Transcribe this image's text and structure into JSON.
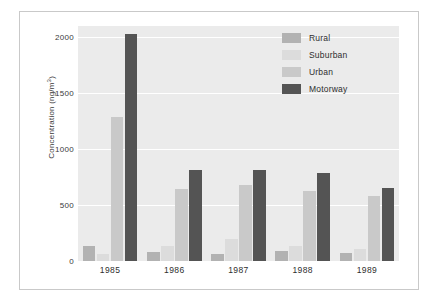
{
  "chart_data": {
    "type": "bar",
    "title": "",
    "xlabel": "",
    "ylabel": "Concentration (ng/m3)",
    "ylabel_unit_base": "Concentration (ng/m",
    "ylabel_unit_sup": "3",
    "ylabel_unit_tail": ")",
    "categories": [
      "1985",
      "1986",
      "1987",
      "1988",
      "1989"
    ],
    "ylim": [
      0,
      2100
    ],
    "yticks": [
      0,
      500,
      1000,
      1500,
      2000
    ],
    "ytick_labels": [
      "0",
      "500",
      "1000",
      "1500",
      "2000"
    ],
    "grid": true,
    "legend_position": "top-right",
    "series": [
      {
        "name": "Rural",
        "color": "#b2b2b2",
        "values": [
          130,
          80,
          65,
          90,
          75
        ]
      },
      {
        "name": "Suburban",
        "color": "#dcdcdc",
        "values": [
          60,
          130,
          195,
          135,
          110
        ]
      },
      {
        "name": "Urban",
        "color": "#c9c9c9",
        "values": [
          1290,
          640,
          680,
          625,
          585
        ]
      },
      {
        "name": "Motorway",
        "color": "#545454",
        "values": [
          2030,
          810,
          815,
          785,
          650
        ]
      }
    ]
  },
  "figure": {
    "background": "#ffffff",
    "plot_background": "#ebebeb",
    "gridline_color": "#ffffff",
    "border_color": "#c9c9c9"
  }
}
